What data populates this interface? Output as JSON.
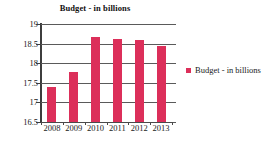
{
  "chart_data": {
    "type": "bar",
    "title": "Budget - in billions",
    "xlabel": "",
    "ylabel": "",
    "categories": [
      "2008",
      "2009",
      "2010",
      "2011",
      "2012",
      "2013"
    ],
    "values": [
      17.4,
      17.77,
      18.67,
      18.62,
      18.6,
      18.43
    ],
    "series": [
      {
        "name": "Budget - in billions",
        "values": [
          17.4,
          17.77,
          18.67,
          18.62,
          18.6,
          18.43
        ]
      }
    ],
    "ylim": [
      16.5,
      19
    ],
    "ytick_step": 0.5,
    "yticks": [
      "19",
      "18.5",
      "18",
      "17.5",
      "17",
      "16.5"
    ],
    "ytick_values": [
      19,
      18.5,
      18,
      17.5,
      17,
      16.5
    ],
    "grid": true,
    "grid_axis": "y",
    "legend": [
      "Budget - in billions"
    ],
    "legend_position": "right",
    "bar_color": "#DC2F5A",
    "grid_color": "#5a5a5a",
    "axis_color": "#3d3d3d",
    "background": "#ffffff"
  },
  "legend": {
    "entries": [
      {
        "label": "Budget - in billions",
        "color": "#DC2F5A",
        "marker": "square-marker"
      }
    ]
  }
}
